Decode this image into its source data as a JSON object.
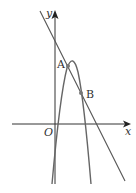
{
  "diagram": {
    "type": "coordinate-graph",
    "axes": {
      "x_label": "x",
      "y_label": "y",
      "origin_label": "O"
    },
    "curves": [
      {
        "name": "line",
        "kind": "straight line, negative slope"
      },
      {
        "name": "parabola",
        "kind": "downward-opening parabola"
      }
    ],
    "points": [
      {
        "label": "A",
        "desc": "intersection of line and parabola, near vertex"
      },
      {
        "label": "B",
        "desc": "intersection of line and parabola, right branch"
      }
    ],
    "colors": {
      "stroke": "#555555",
      "axis": "#333333",
      "point": "#666666",
      "background": "#ffffff"
    }
  }
}
